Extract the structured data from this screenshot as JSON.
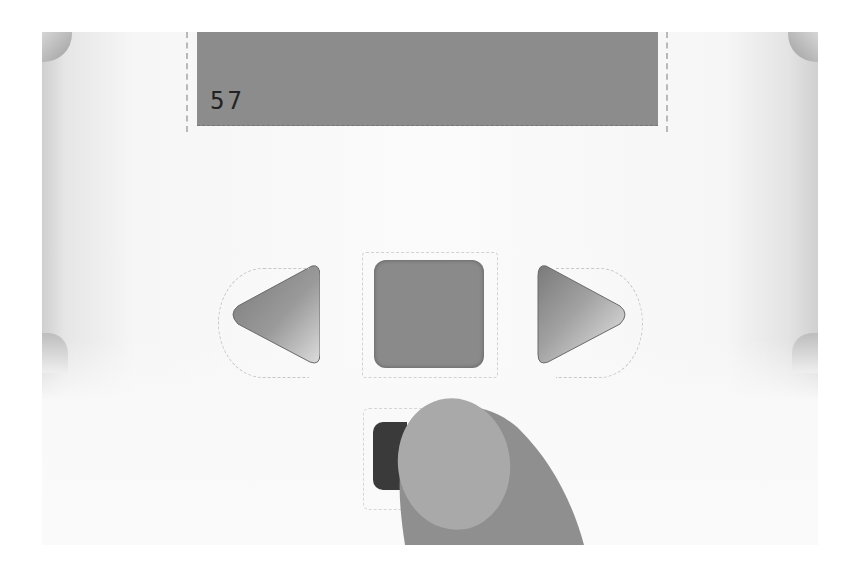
{
  "device": {
    "name": "programmable brick",
    "screen": {
      "display_value": "57",
      "background_color": "#8c8c8c",
      "text_color": "#222222"
    },
    "buttons": {
      "left": {
        "icon": "left-arrow-icon",
        "label": "Left"
      },
      "center": {
        "icon": "center-square-icon",
        "label": "Center"
      },
      "right": {
        "icon": "right-arrow-icon",
        "label": "Right"
      },
      "back": {
        "icon": "back-button-icon",
        "label": "Back",
        "color": "#3a3a3a"
      }
    },
    "pointer": {
      "icon": "finger-pointer-icon",
      "pressing": "back"
    }
  },
  "colors": {
    "body": "#f8f8f8",
    "button_gray": "#8a8a8a",
    "finger_outer": "#8f8f8f",
    "finger_nail": "#a8a8a8"
  }
}
